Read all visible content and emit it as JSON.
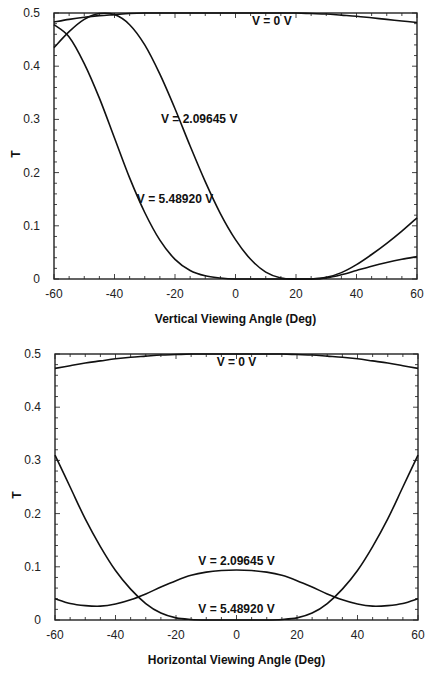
{
  "chart_data": [
    {
      "type": "line",
      "title": "",
      "xlabel": "Vertical Viewing Angle (Deg)",
      "ylabel": "T",
      "xlim": [
        -60,
        60
      ],
      "ylim": [
        0,
        0.5
      ],
      "xticks": [
        -60,
        -40,
        -20,
        0,
        20,
        40,
        60
      ],
      "yticks": [
        0,
        0.1,
        0.2,
        0.3,
        0.4,
        0.5
      ],
      "ytick_labels": [
        "0",
        "0.1",
        "0.2",
        "0.3",
        "0.4",
        "0.5"
      ],
      "grid": false,
      "x": [
        -60,
        -55,
        -50,
        -45,
        -40,
        -35,
        -30,
        -25,
        -20,
        -15,
        -10,
        -5,
        0,
        5,
        10,
        15,
        20,
        25,
        30,
        35,
        40,
        45,
        50,
        55,
        60
      ],
      "series": [
        {
          "name": "V = 0 V",
          "label_pos": [
            12,
            0.485
          ],
          "values": [
            0.483,
            0.488,
            0.492,
            0.495,
            0.497,
            0.499,
            0.5,
            0.5,
            0.5,
            0.5,
            0.5,
            0.5,
            0.5,
            0.5,
            0.5,
            0.5,
            0.5,
            0.499,
            0.498,
            0.496,
            0.494,
            0.491,
            0.488,
            0.485,
            0.482
          ]
        },
        {
          "name": "V = 2.09645 V",
          "label_pos": [
            -12,
            0.3
          ],
          "values": [
            0.435,
            0.465,
            0.488,
            0.499,
            0.497,
            0.478,
            0.44,
            0.385,
            0.32,
            0.25,
            0.183,
            0.123,
            0.074,
            0.037,
            0.013,
            0.002,
            0.0,
            0.0,
            0.003,
            0.012,
            0.027,
            0.046,
            0.067,
            0.09,
            0.115
          ]
        },
        {
          "name": "V = 5.48920 V",
          "label_pos": [
            -20,
            0.15
          ],
          "values": [
            0.478,
            0.455,
            0.405,
            0.34,
            0.265,
            0.19,
            0.125,
            0.073,
            0.037,
            0.016,
            0.006,
            0.002,
            0.0,
            0.0,
            0.0,
            0.0,
            0.0,
            0.0,
            0.002,
            0.008,
            0.016,
            0.024,
            0.031,
            0.037,
            0.042
          ]
        }
      ]
    },
    {
      "type": "line",
      "title": "",
      "xlabel": "Horizontal Viewing Angle (Deg)",
      "ylabel": "T",
      "xlim": [
        -60,
        60
      ],
      "ylim": [
        0,
        0.5
      ],
      "xticks": [
        -60,
        -40,
        -20,
        0,
        20,
        40,
        60
      ],
      "yticks": [
        0,
        0.1,
        0.2,
        0.3,
        0.4,
        0.5
      ],
      "ytick_labels": [
        "0",
        "0.1",
        "0.2",
        "0.3",
        "0.4",
        "0.5"
      ],
      "grid": false,
      "x": [
        -60,
        -55,
        -50,
        -45,
        -40,
        -35,
        -30,
        -25,
        -20,
        -15,
        -10,
        -5,
        0,
        5,
        10,
        15,
        20,
        25,
        30,
        35,
        40,
        45,
        50,
        55,
        60
      ],
      "series": [
        {
          "name": "V = 0 V",
          "label_pos": [
            0,
            0.485
          ],
          "values": [
            0.473,
            0.478,
            0.483,
            0.487,
            0.491,
            0.494,
            0.496,
            0.498,
            0.499,
            0.5,
            0.5,
            0.5,
            0.5,
            0.5,
            0.5,
            0.5,
            0.499,
            0.498,
            0.496,
            0.494,
            0.491,
            0.487,
            0.483,
            0.478,
            0.473
          ]
        },
        {
          "name": "V = 2.09645 V",
          "label_pos": [
            0,
            0.11
          ],
          "values": [
            0.04,
            0.031,
            0.027,
            0.026,
            0.03,
            0.038,
            0.049,
            0.062,
            0.074,
            0.084,
            0.09,
            0.093,
            0.094,
            0.093,
            0.09,
            0.084,
            0.074,
            0.062,
            0.049,
            0.038,
            0.03,
            0.026,
            0.027,
            0.031,
            0.04
          ]
        },
        {
          "name": "V = 5.48920 V",
          "label_pos": [
            0,
            0.02
          ],
          "values": [
            0.31,
            0.25,
            0.19,
            0.138,
            0.093,
            0.058,
            0.031,
            0.013,
            0.004,
            0.001,
            0.0,
            0.0,
            0.0,
            0.0,
            0.0,
            0.001,
            0.004,
            0.013,
            0.031,
            0.058,
            0.093,
            0.138,
            0.19,
            0.25,
            0.31
          ]
        }
      ]
    }
  ],
  "caption": "Figure (caption text truncated at bottom edge)"
}
